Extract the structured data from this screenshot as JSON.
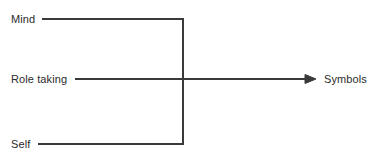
{
  "diagram": {
    "type": "flow-convergence",
    "background_color": "#ffffff",
    "line_color": "#3a3a3a",
    "text_color": "#2b2b2b",
    "line_width": 2,
    "inputs": [
      {
        "id": "mind",
        "label": "Mind",
        "y": 19
      },
      {
        "id": "role_taking",
        "label": "Role taking",
        "y": 79
      },
      {
        "id": "self",
        "label": "Self",
        "y": 144
      }
    ],
    "output": {
      "id": "symbols",
      "label": "Symbols",
      "y": 79
    },
    "junction_x": 183,
    "arrow_tip_x": 316,
    "connectors": [
      {
        "from": "mind",
        "to": "junction",
        "shape": "horizontal-then-vertical"
      },
      {
        "from": "role_taking",
        "to": "symbols",
        "shape": "horizontal-arrow"
      },
      {
        "from": "self",
        "to": "junction",
        "shape": "horizontal-then-vertical"
      }
    ],
    "arrowhead": {
      "style": "filled-triangle",
      "width": 11,
      "height": 9
    }
  }
}
